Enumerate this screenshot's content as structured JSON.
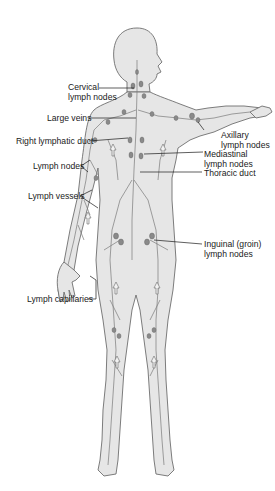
{
  "figure": {
    "labels": {
      "cervical_1": "Cervical",
      "cervical_2": "lymph nodes",
      "large_veins": "Large veins",
      "right_lymphatic_duct": "Right lymphatic duct",
      "lymph_nodes": "Lymph nodes",
      "lymph_vessels": "Lymph vessels",
      "lymph_capillaries": "Lymph capillaries",
      "axillary_1": "Axillary",
      "axillary_2": "lymph nodes",
      "mediastinal_1": "Mediastinal",
      "mediastinal_2": "lymph nodes",
      "thoracic_duct": "Thoracic duct",
      "inguinal_1": "Inguinal (groin)",
      "inguinal_2": "lymph nodes"
    },
    "colors": {
      "body": "#e6e6e6",
      "outline": "#6e6e6e",
      "vessels": "#7a7a7a",
      "text": "#1a1a1a"
    }
  }
}
